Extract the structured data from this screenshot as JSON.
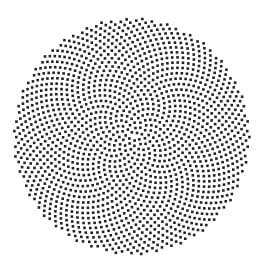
{
  "figure": {
    "type": "phyllotaxis-spiral",
    "width": 262,
    "height": 272,
    "background": "#ffffff",
    "dot_color": "#222222",
    "center": [
      131.5,
      136.5
    ],
    "radius": 118,
    "dot_count": 1600,
    "dot_size": 2.6,
    "golden_angle_deg": 137.508
  }
}
